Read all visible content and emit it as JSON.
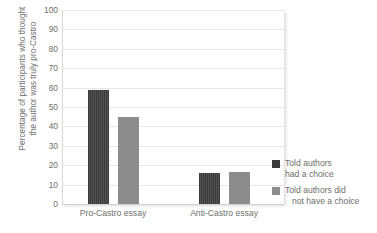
{
  "chart_data": {
    "type": "bar",
    "title": "",
    "xlabel": "",
    "ylabel": "Percentage of participants who thought the author was truly pro-Castro",
    "ylabel_lines": [
      "Percentage of participants who thought",
      "the author was truly pro-Castro"
    ],
    "categories": [
      "Pro-Castro essay",
      "Anti-Castro essay"
    ],
    "ylim": [
      0,
      100
    ],
    "ytick_step": 10,
    "yticks": [
      0,
      10,
      20,
      30,
      40,
      50,
      60,
      70,
      80,
      90,
      100
    ],
    "grid": true,
    "legend_position": "right",
    "series": [
      {
        "name": "Told authors had a choice",
        "name_lines": [
          "Told authors",
          "had a choice"
        ],
        "color": "#3a3a3a",
        "values": [
          59,
          16
        ]
      },
      {
        "name": "Told authors did not have a choice",
        "name_lines": [
          "Told authors did",
          "not have a choice"
        ],
        "color": "#8c8c8c",
        "values": [
          45,
          16.5
        ]
      }
    ]
  },
  "colors": {
    "series_dark": "#3a3a3a",
    "series_grey": "#8c8c8c",
    "gridline": "#e6e6e6",
    "axis": "#d0d0d0",
    "text": "#6e6e6e",
    "background": "#ffffff"
  }
}
